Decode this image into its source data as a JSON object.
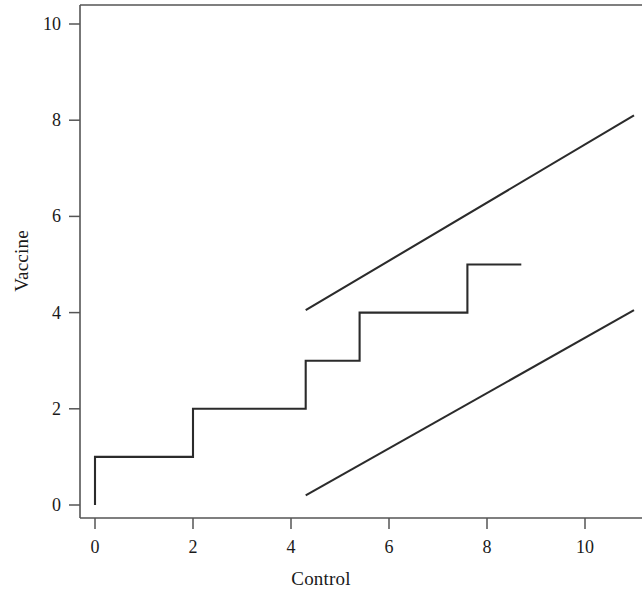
{
  "chart_data": {
    "type": "line",
    "title": "",
    "xlabel": "Control",
    "ylabel": "Vaccine",
    "xlim": [
      -0.35,
      11.2
    ],
    "ylim": [
      -0.45,
      10.6
    ],
    "xticks": [
      0,
      2,
      4,
      6,
      8,
      10
    ],
    "yticks": [
      0,
      2,
      4,
      6,
      8,
      10
    ],
    "xtick_labels": [
      "0",
      "2",
      "4",
      "6",
      "8",
      "10"
    ],
    "ytick_labels": [
      "0",
      "2",
      "4",
      "6",
      "8",
      "10"
    ],
    "grid": false,
    "legend": null,
    "series": [
      {
        "name": "empirical-step-curve",
        "type": "step",
        "drawstyle": "steps-post",
        "color": "#2b2b2b",
        "points": [
          [
            0,
            0
          ],
          [
            0,
            1
          ],
          [
            2,
            1
          ],
          [
            2,
            2
          ],
          [
            4.3,
            2
          ],
          [
            4.3,
            3
          ],
          [
            5.4,
            3
          ],
          [
            5.4,
            4
          ],
          [
            7.6,
            4
          ],
          [
            7.6,
            5
          ],
          [
            8.7,
            5
          ]
        ]
      },
      {
        "name": "upper-confidence-band",
        "type": "line",
        "color": "#2b2b2b",
        "points": [
          [
            4.3,
            4.05
          ],
          [
            11.0,
            8.1
          ]
        ]
      },
      {
        "name": "lower-confidence-band",
        "type": "line",
        "color": "#2b2b2b",
        "points": [
          [
            4.3,
            0.2
          ],
          [
            11.0,
            4.05
          ]
        ]
      }
    ],
    "annotations": [],
    "axis_style": {
      "left_spine": true,
      "top_spine": true,
      "bottom_spine": true,
      "right_spine": false,
      "tick_direction": "out",
      "spine_color": "#555555"
    }
  },
  "figure": {
    "background_color": "#ffffff",
    "line_color": "#2b2b2b",
    "text_color": "#1a1a1a"
  }
}
